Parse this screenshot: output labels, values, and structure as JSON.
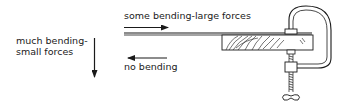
{
  "diagram": {
    "labels": {
      "top": "some bending-large forces",
      "left_line1": "much bending-",
      "left_line2": "small forces",
      "bottom": "no bending"
    },
    "parts": [
      "ruler-strip",
      "wooden-block",
      "g-clamp",
      "force-arrow-right",
      "force-arrow-down",
      "force-arrow-left"
    ],
    "colors": {
      "ink": "#1a1a1a",
      "background": "#ffffff"
    }
  }
}
